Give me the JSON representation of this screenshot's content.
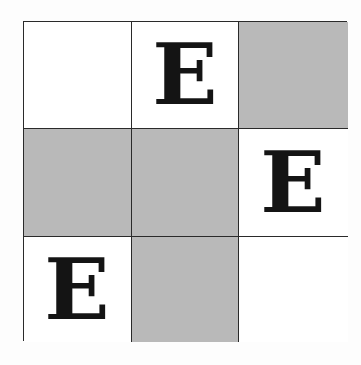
{
  "grid": {
    "rows": 3,
    "cols": 3,
    "colors": {
      "shaded": "#b9b9b9",
      "blank": "#ffffff",
      "line": "#2a2a2a",
      "letter": "#141414"
    },
    "cells": [
      {
        "row": 0,
        "col": 0,
        "shaded": false,
        "letter": ""
      },
      {
        "row": 0,
        "col": 1,
        "shaded": false,
        "letter": "E"
      },
      {
        "row": 0,
        "col": 2,
        "shaded": true,
        "letter": ""
      },
      {
        "row": 1,
        "col": 0,
        "shaded": true,
        "letter": ""
      },
      {
        "row": 1,
        "col": 1,
        "shaded": true,
        "letter": ""
      },
      {
        "row": 1,
        "col": 2,
        "shaded": false,
        "letter": "E"
      },
      {
        "row": 2,
        "col": 0,
        "shaded": false,
        "letter": "E"
      },
      {
        "row": 2,
        "col": 1,
        "shaded": true,
        "letter": ""
      },
      {
        "row": 2,
        "col": 2,
        "shaded": false,
        "letter": ""
      }
    ]
  }
}
